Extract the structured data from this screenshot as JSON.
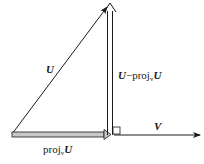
{
  "diagram": {
    "labels": {
      "u": "U",
      "v": "V",
      "proj_prefix": "proj",
      "proj_sub": "v",
      "proj_vec": "U",
      "orth_u": "U",
      "orth_minus": "−proj",
      "orth_sub": "v",
      "orth_vec": "U"
    },
    "vectors": [
      {
        "name": "U",
        "from": [
          12,
          134
        ],
        "to": [
          108,
          6
        ],
        "style": "thin"
      },
      {
        "name": "V",
        "from": [
          118,
          135
        ],
        "to": [
          201,
          135
        ],
        "style": "thin"
      },
      {
        "name": "proj_v U",
        "from": [
          12,
          135
        ],
        "to": [
          110,
          135
        ],
        "style": "double-shaded"
      },
      {
        "name": "U - proj_v U",
        "from": [
          110,
          135
        ],
        "to": [
          110,
          5
        ],
        "style": "double"
      }
    ],
    "right_angle_marker": {
      "x": 110,
      "y": 127,
      "size": 8
    },
    "colors": {
      "line": "#1a1a1a",
      "shade": "#c8c8c8"
    }
  }
}
